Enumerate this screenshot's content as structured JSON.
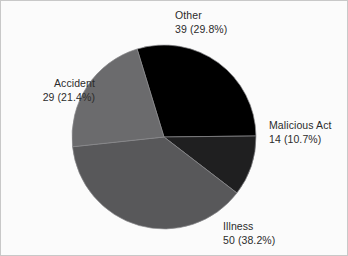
{
  "chart_data": {
    "type": "pie",
    "title": "",
    "subtitle": "",
    "xlabel": "",
    "ylabel": "",
    "legend_position": "none",
    "grid": false,
    "total": 131,
    "categories": [
      "Other",
      "Malicious Act",
      "Illness",
      "Accident"
    ],
    "values": [
      39,
      14,
      50,
      29
    ],
    "percentages": [
      29.8,
      10.7,
      38.2,
      21.4
    ],
    "colors": [
      "#000000",
      "#1f1f20",
      "#58585a",
      "#6b6b6d"
    ],
    "start_angle_deg": -17,
    "direction": "clockwise",
    "slices": [
      {
        "name": "Other",
        "value": 39,
        "percent": 29.8,
        "color": "#000000",
        "label_line1": "Other",
        "label_line2": "39 (29.8%)",
        "label_position": "top"
      },
      {
        "name": "Malicious Act",
        "value": 14,
        "percent": 10.7,
        "color": "#1f1f20",
        "label_line1": "Malicious Act",
        "label_line2": "14 (10.7%)",
        "label_position": "right"
      },
      {
        "name": "Illness",
        "value": 50,
        "percent": 38.2,
        "color": "#58585a",
        "label_line1": "Illness",
        "label_line2": "50 (38.2%)",
        "label_position": "bottom"
      },
      {
        "name": "Accident",
        "value": 29,
        "percent": 21.4,
        "color": "#6b6b6d",
        "label_line1": "Accident",
        "label_line2": "29 (21.4%)",
        "label_position": "left"
      }
    ]
  },
  "labels": {
    "other": {
      "line1": "Other",
      "line2": "39 (29.8%)"
    },
    "accident": {
      "line1": "Accident",
      "line2": "29 (21.4%)"
    },
    "malicious": {
      "line1": "Malicious Act",
      "line2": "14 (10.7%)"
    },
    "illness": {
      "line1": "Illness",
      "line2": "50 (38.2%)"
    }
  },
  "geometry": {
    "center_x": 163,
    "center_y": 136,
    "radius": 92
  }
}
